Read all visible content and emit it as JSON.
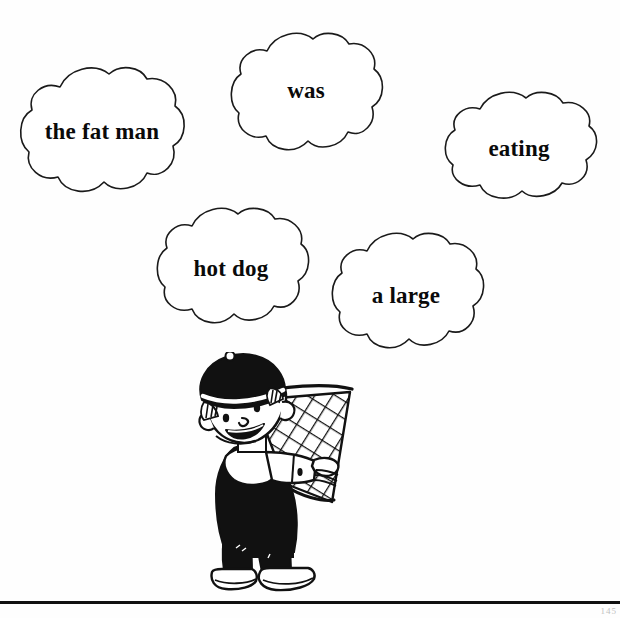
{
  "page": {
    "background_color": "#fefefe",
    "ink_color": "#0a0a0a",
    "page_number": "145"
  },
  "worksheet": {
    "type": "scrambled-sentence-clouds",
    "clouds": [
      {
        "id": "cloud-1",
        "label": "the fat man"
      },
      {
        "id": "cloud-2",
        "label": "was"
      },
      {
        "id": "cloud-3",
        "label": "eating"
      },
      {
        "id": "cloud-4",
        "label": "hot dog"
      },
      {
        "id": "cloud-5",
        "label": "a large"
      }
    ]
  },
  "illustration": {
    "name": "boy-with-butterfly-net",
    "description": "line-art boy wearing a cap holding a butterfly net"
  },
  "footer": {
    "rule": "horizontal-rule"
  }
}
